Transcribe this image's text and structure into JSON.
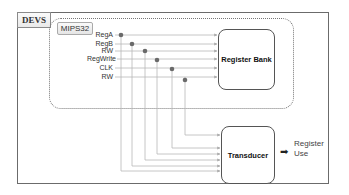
{
  "diagram": {
    "outer_container": {
      "label": "DEVS"
    },
    "inner_container": {
      "label": "MIPS32"
    },
    "signals": [
      {
        "label": "RegA",
        "y": 35,
        "tap_x": 121
      },
      {
        "label": "RegB",
        "y": 44,
        "tap_x": 132
      },
      {
        "label": "RW",
        "y": 51,
        "tap_x": 145
      },
      {
        "label": "RegWrite",
        "y": 59,
        "tap_x": 157
      },
      {
        "label": "CLK",
        "y": 68,
        "tap_x": 172
      },
      {
        "label": "RW",
        "y": 77,
        "tap_x": 185
      }
    ],
    "blocks": {
      "register_bank": {
        "label": "Register Bank"
      },
      "transducer": {
        "label": "Transducer"
      }
    },
    "output": {
      "arrow": "➡",
      "line1": "Register",
      "line2": "Use"
    },
    "colors": {
      "line": "#b5b5b5",
      "dot": "#666666",
      "border": "#555555"
    }
  }
}
